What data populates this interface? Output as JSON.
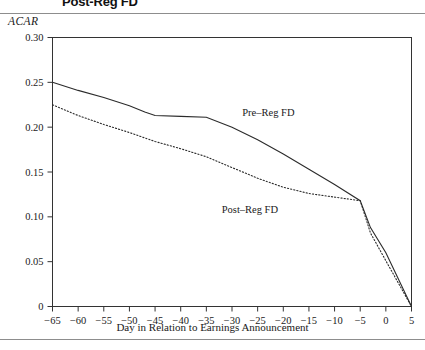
{
  "figure": {
    "title": "Post-Reg FD",
    "y_axis_title": "ACAR",
    "x_axis_title": "Day in Relation to Earnings Announcement"
  },
  "labels": {
    "pre_reg": "Pre–Reg FD",
    "post_reg": "Post–Reg FD"
  },
  "ticks": {
    "y": [
      "0",
      "0.05",
      "0.10",
      "0.15",
      "0.20",
      "0.25",
      "0.30"
    ],
    "x": [
      "−65",
      "−60",
      "−55",
      "−50",
      "−45",
      "−40",
      "−35",
      "−30",
      "−25",
      "−20",
      "−15",
      "−10",
      "−5",
      "0",
      "5"
    ]
  },
  "colors": {
    "axis": "#333333",
    "line": "#2b2b2b",
    "rule": "#8d8d8d",
    "background": "#ffffff"
  },
  "chart_data": {
    "type": "line",
    "title": "Post-Reg FD",
    "xlabel": "Day in Relation to Earnings Announcement",
    "ylabel": "ACAR",
    "xlim": [
      -65,
      5
    ],
    "ylim": [
      0,
      0.3
    ],
    "ytick_values": [
      0,
      0.05,
      0.1,
      0.15,
      0.2,
      0.25,
      0.3
    ],
    "xtick_values": [
      -65,
      -60,
      -55,
      -50,
      -45,
      -40,
      -35,
      -30,
      -25,
      -20,
      -15,
      -10,
      -5,
      0,
      5
    ],
    "grid": false,
    "legend": "inline-annotations",
    "x": [
      -65,
      -60,
      -55,
      -50,
      -47,
      -45,
      -40,
      -35,
      -30,
      -25,
      -20,
      -15,
      -10,
      -5,
      -3,
      0,
      5
    ],
    "series": [
      {
        "name": "Pre–Reg FD",
        "style": "solid",
        "label_x": -28,
        "label_y": 0.213,
        "values": [
          0.25,
          0.241,
          0.233,
          0.224,
          0.217,
          0.213,
          0.212,
          0.211,
          0.2,
          0.186,
          0.17,
          0.153,
          0.136,
          0.118,
          0.088,
          0.06,
          0.0
        ]
      },
      {
        "name": "Post–Reg FD",
        "style": "dotted",
        "label_x": -32,
        "label_y": 0.104,
        "values": [
          0.225,
          0.213,
          0.203,
          0.194,
          0.188,
          0.184,
          0.176,
          0.167,
          0.155,
          0.143,
          0.133,
          0.126,
          0.122,
          0.118,
          0.082,
          0.051,
          0.0
        ]
      }
    ]
  }
}
